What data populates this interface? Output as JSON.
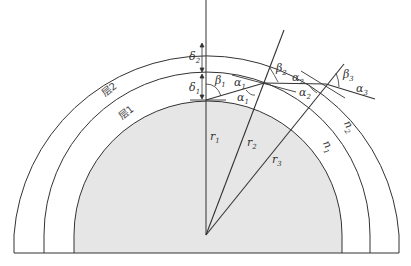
{
  "diagram": {
    "title": "",
    "layers": [
      {
        "id": "layer1",
        "label": "层1",
        "refractive_index": "n1",
        "thickness": "δ1"
      },
      {
        "id": "layer2",
        "label": "层2",
        "refractive_index": "n2",
        "thickness": "δ2"
      }
    ],
    "radii": [
      {
        "label": "r",
        "sub": "1"
      },
      {
        "label": "r",
        "sub": "2"
      },
      {
        "label": "r",
        "sub": "3"
      }
    ],
    "thicknesses": [
      {
        "label": "δ",
        "sub": "2"
      },
      {
        "label": "δ",
        "sub": "1"
      }
    ],
    "angles": {
      "beta1": {
        "label": "β",
        "sub": "1"
      },
      "beta2": {
        "label": "β",
        "sub": "2"
      },
      "beta3": {
        "label": "β",
        "sub": "3"
      },
      "alpha1_upper": {
        "label": "α",
        "sub": "1"
      },
      "alpha1_lower": {
        "label": "α",
        "sub": "1"
      },
      "alpha2_upper": {
        "label": "α",
        "sub": "2"
      },
      "alpha2_lower": {
        "label": "α",
        "sub": "2"
      },
      "alpha3": {
        "label": "α",
        "sub": "3"
      }
    },
    "indices": {
      "n1": {
        "label": "n",
        "sub": "1"
      },
      "n2": {
        "label": "n",
        "sub": "2"
      }
    },
    "colors": {
      "core_fill": "#e6e6e6",
      "line": "#333333"
    }
  }
}
